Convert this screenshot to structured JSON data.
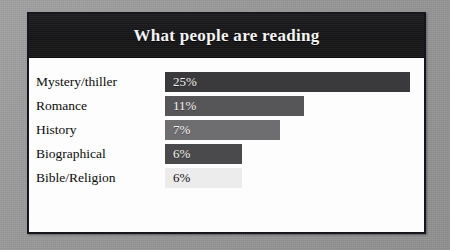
{
  "page": {
    "background_color": "#9b9b9b",
    "card_background_color": "#ffffff",
    "card_border_color": "#15151a",
    "header_background_color": "#161618",
    "title_color": "#f4f4f2"
  },
  "header": {
    "title": "What people are reading"
  },
  "chart_data": {
    "type": "bar",
    "title": "What people are reading",
    "subtitle": "",
    "xlabel": "",
    "ylabel": "",
    "orientation": "horizontal",
    "grid": false,
    "legend": false,
    "legend_position": "none",
    "axis_visible": false,
    "tick_labels": [],
    "categories": [
      "Mystery/thiller",
      "Romance",
      "History",
      "Biographical",
      "Bible/Religion"
    ],
    "values": [
      25,
      11,
      7,
      6,
      6
    ],
    "value_labels": [
      "25%",
      "11%",
      "7%",
      "6%",
      "6%"
    ],
    "bar_colors": [
      "#3a3a3c",
      "#565658",
      "#6e6e70",
      "#4a4a4c",
      "#ececec"
    ],
    "bar_pixel_widths": [
      245,
      139,
      115,
      77,
      77
    ],
    "bar_text_colors": [
      "#f2f2f0",
      "#f2f2f0",
      "#f2f2f0",
      "#f2f2f0",
      "#101010"
    ],
    "xlim": [
      0,
      25
    ],
    "ylim": [
      0,
      5
    ],
    "note": "Bar lengths are drawn as a decreasing staircase and are not proportional to the percentage values."
  },
  "rows": [
    {
      "label": "Mystery/thiller",
      "value_label": "25%",
      "value": 25,
      "color": "#3a3a3c",
      "width_px": 245,
      "text_tone": "light"
    },
    {
      "label": "Romance",
      "value_label": "11%",
      "value": 11,
      "color": "#565658",
      "width_px": 139,
      "text_tone": "light"
    },
    {
      "label": "History",
      "value_label": "7%",
      "value": 7,
      "color": "#6e6e70",
      "width_px": 115,
      "text_tone": "light"
    },
    {
      "label": "Biographical",
      "value_label": "6%",
      "value": 6,
      "color": "#4a4a4c",
      "width_px": 77,
      "text_tone": "light"
    },
    {
      "label": "Bible/Religion",
      "value_label": "6%",
      "value": 6,
      "color": "#ececec",
      "width_px": 77,
      "text_tone": "dark"
    }
  ]
}
